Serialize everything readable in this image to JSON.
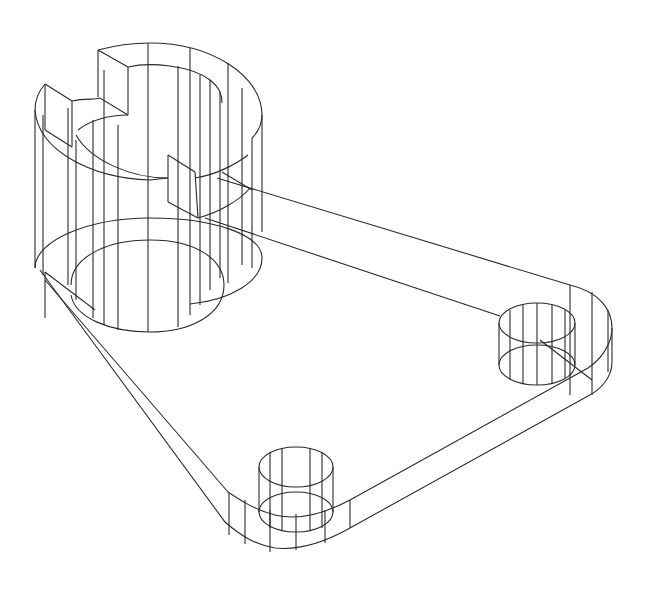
{
  "drawing": {
    "type": "isometric wireframe",
    "subject": "bracket plate with slotted cylindrical boss and two pin holes",
    "line_color": "#2a2a2a",
    "background": "#ffffff",
    "features": [
      {
        "name": "large-cylinder-boss",
        "has_slots": true,
        "slot_count": 2
      },
      {
        "name": "pin-boss-right"
      },
      {
        "name": "pin-boss-bottom"
      },
      {
        "name": "triangular-base-plate",
        "rounded_corners": true
      }
    ]
  }
}
